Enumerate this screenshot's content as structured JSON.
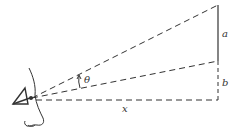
{
  "diagram": {
    "type": "line-of-sight geometry",
    "labels": {
      "segment_a": "a",
      "segment_b": "b",
      "horizontal_distance": "x",
      "angle": "θ"
    },
    "colors": {
      "line": "#333333",
      "background": "#ffffff"
    },
    "elements": [
      "face profile with eye at left",
      "dashed sight line to top of segment a",
      "dashed sight line to bottom of segment a (top of b)",
      "dashed horizontal baseline of length x",
      "solid vertical segment a",
      "dashed vertical segment b",
      "angle θ arc between the two sight lines"
    ]
  }
}
